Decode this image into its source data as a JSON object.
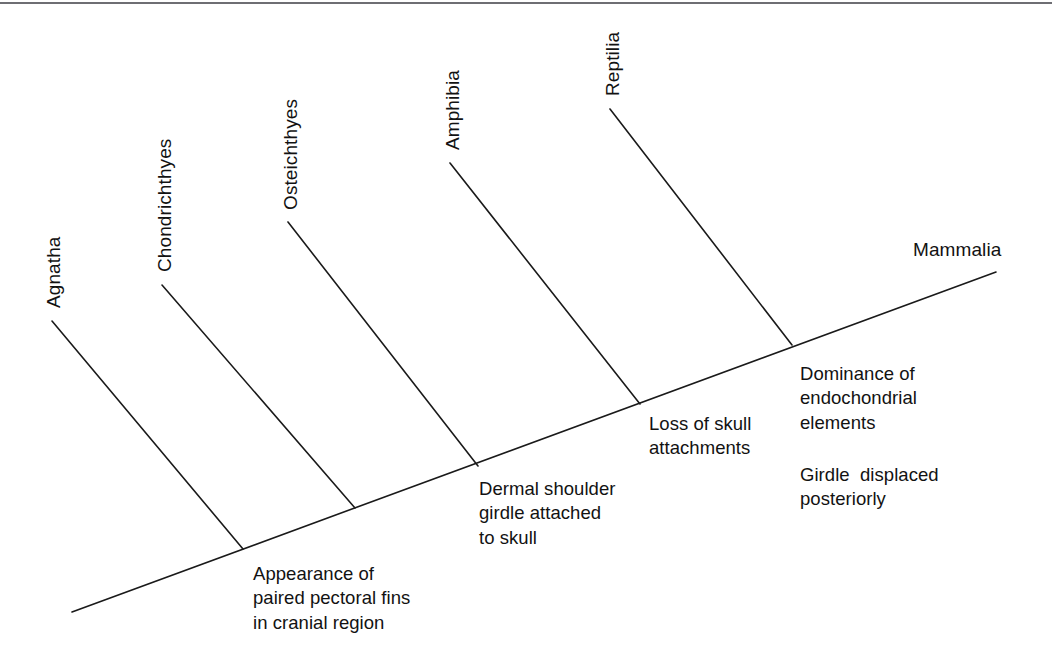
{
  "figure": {
    "type": "cladogram",
    "title": "",
    "background_color": "#ffffff",
    "line_color": "#1a1a1a",
    "text_color": "#121212",
    "border_color": "#6e6e73"
  },
  "taxa": [
    {
      "label": "Agnatha",
      "orientation": "vertical"
    },
    {
      "label": "Chondrichthyes",
      "orientation": "vertical"
    },
    {
      "label": "Osteichthyes",
      "orientation": "vertical"
    },
    {
      "label": "Amphibia",
      "orientation": "vertical"
    },
    {
      "label": "Reptilia",
      "orientation": "vertical"
    },
    {
      "label": "Mammalia",
      "orientation": "horizontal"
    }
  ],
  "traits": [
    {
      "lines": [
        "Appearance of",
        "paired pectoral fins",
        "in cranial region"
      ]
    },
    {
      "lines": [
        "Dermal shoulder",
        "girdle attached",
        "to skull"
      ]
    },
    {
      "lines": [
        "Loss of skull",
        "attachments"
      ]
    },
    {
      "lines": [
        "Dominance of",
        "endochondrial",
        "elements"
      ]
    },
    {
      "lines": [
        "Girdle  displaced",
        "posteriorly"
      ]
    }
  ],
  "chart_data": {
    "type": "diagram",
    "title": "",
    "backbone": {
      "x1": 72,
      "y1": 612,
      "x2": 996,
      "y2": 272
    },
    "branches": [
      {
        "taxon": "Agnatha",
        "tip_x": 52,
        "tip_y": 321,
        "node_x": 243,
        "node_y": 549
      },
      {
        "taxon": "Chondrichthyes",
        "tip_x": 162,
        "tip_y": 285,
        "node_x": 355,
        "node_y": 508
      },
      {
        "taxon": "Osteichthyes",
        "tip_x": 288,
        "tip_y": 222,
        "node_x": 478,
        "node_y": 466
      },
      {
        "taxon": "Amphibia",
        "tip_x": 450,
        "tip_y": 163,
        "node_x": 640,
        "node_y": 404
      },
      {
        "taxon": "Reptilia",
        "tip_x": 610,
        "tip_y": 109,
        "node_x": 792,
        "node_y": 345
      }
    ]
  }
}
